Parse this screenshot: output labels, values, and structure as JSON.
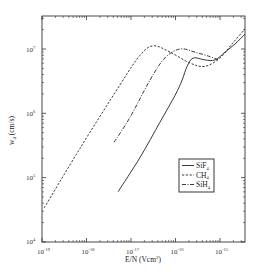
{
  "chart_data": {
    "type": "line",
    "title": "",
    "xlabel": "E/N (Vcm²)",
    "ylabel": "w_d (cm/s)",
    "x_scale": "log",
    "y_scale": "log",
    "xlim": [
      1e-19,
      3.6e-15
    ],
    "ylim": [
      10000.0,
      33000000.0
    ],
    "grid": false,
    "legend_position": "lower right (inside)",
    "x_ticks": [
      {
        "value": -19,
        "label": "10",
        "exp": "-19"
      },
      {
        "value": -18,
        "label": "10",
        "exp": "-18"
      },
      {
        "value": -17,
        "label": "10",
        "exp": "-17"
      },
      {
        "value": -16,
        "label": "10",
        "exp": "-16"
      },
      {
        "value": -15,
        "label": "10",
        "exp": "-15"
      }
    ],
    "y_ticks": [
      {
        "value": 4,
        "label": "10",
        "exp": "4"
      },
      {
        "value": 5,
        "label": "10",
        "exp": "5"
      },
      {
        "value": 6,
        "label": "10",
        "exp": "6"
      },
      {
        "value": 7,
        "label": "10",
        "exp": "7"
      }
    ],
    "series": [
      {
        "name": "SiF4",
        "legend_label": "SiF",
        "legend_sub": "4",
        "style": "solid",
        "log10_x": [
          -17.29,
          -16.8,
          -16.35,
          -16.01,
          -15.85,
          -15.74,
          -15.6,
          -15.34,
          -15.11,
          -14.89,
          -14.66,
          -14.44
        ],
        "log10_y": [
          4.78,
          5.31,
          5.86,
          6.28,
          6.52,
          6.73,
          6.86,
          6.83,
          6.83,
          6.95,
          7.08,
          7.23
        ]
      },
      {
        "name": "CH4",
        "legend_label": "CH",
        "legend_sub": "4",
        "style": "dashed",
        "log10_x": [
          -18.95,
          -18.15,
          -17.25,
          -16.8,
          -16.5,
          -16.12,
          -15.67,
          -15.34,
          -15.0,
          -14.73,
          -14.44
        ],
        "log10_y": [
          4.53,
          5.45,
          6.44,
          6.9,
          7.05,
          6.95,
          6.78,
          6.73,
          6.86,
          7.08,
          7.31
        ]
      },
      {
        "name": "SiH4",
        "legend_label": "SiH",
        "legend_sub": "4",
        "style": "dashdot",
        "log10_x": [
          -17.38,
          -17.02,
          -16.57,
          -16.24,
          -15.9,
          -15.56,
          -15.22,
          -15.04
        ],
        "log10_y": [
          5.55,
          5.94,
          6.52,
          6.86,
          7.0,
          6.95,
          6.88,
          6.83
        ]
      }
    ]
  },
  "axes": {
    "x_title": "E/N (Vcm",
    "x_title_sup": "2",
    "x_title_end": ")",
    "y_title": "w",
    "y_title_sub": "d",
    "y_title_unit": " (cm/s)"
  }
}
